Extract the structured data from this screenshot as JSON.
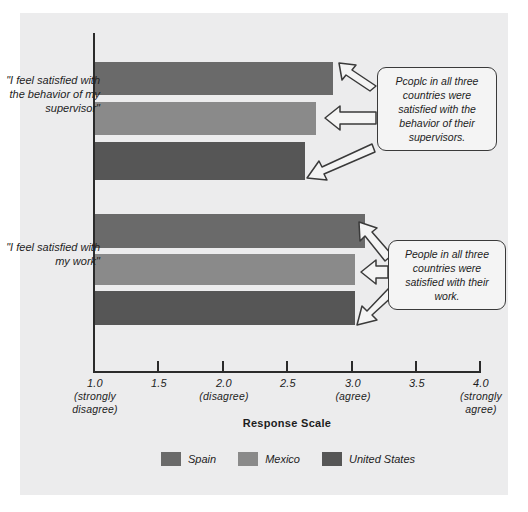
{
  "chart_data": {
    "type": "bar",
    "orientation": "horizontal",
    "title": "",
    "xlabel": "Response Scale",
    "ylabel": "",
    "xlim": [
      1.0,
      4.0
    ],
    "grid": false,
    "legend_position": "bottom",
    "categories": [
      "\"I feel satisfied with the behavior of my supervisor\"",
      "\"I feel satisfied with my work\""
    ],
    "series": [
      {
        "name": "Spain",
        "color": "#6a6a6a",
        "values": [
          2.85,
          3.1
        ]
      },
      {
        "name": "Mexico",
        "color": "#8a8a8a",
        "values": [
          2.72,
          3.02
        ]
      },
      {
        "name": "United States",
        "color": "#565656",
        "values": [
          2.63,
          3.02
        ]
      }
    ],
    "xticks": [
      {
        "value": 1.0,
        "label": "1.0",
        "sublabel": "(strongly disagree)"
      },
      {
        "value": 1.5,
        "label": "1.5",
        "sublabel": ""
      },
      {
        "value": 2.0,
        "label": "2.0",
        "sublabel": "(disagree)"
      },
      {
        "value": 2.5,
        "label": "2.5",
        "sublabel": ""
      },
      {
        "value": 3.0,
        "label": "3.0",
        "sublabel": "(agree)"
      },
      {
        "value": 3.5,
        "label": "3.5",
        "sublabel": ""
      },
      {
        "value": 4.0,
        "label": "4.0",
        "sublabel": "(strongly agree)"
      }
    ],
    "annotations": [
      "Pcoplc in all three countries were satisfied with the behavior of their supervisors.",
      "People in all three countries were satisfied with their work."
    ]
  },
  "axis": {
    "x_title": "Response Scale",
    "tick_1_0": "1.0",
    "tick_1_0_sub": "(strongly disagree)",
    "tick_1_5": "1.5",
    "tick_2_0": "2.0",
    "tick_2_0_sub": "(disagree)",
    "tick_2_5": "2.5",
    "tick_3_0": "3.0",
    "tick_3_0_sub": "(agree)",
    "tick_3_5": "3.5",
    "tick_4_0": "4.0",
    "tick_4_0_sub": "(strongly agree)"
  },
  "categories": {
    "supervisor": "\"I feel satisfied with the behavior of my supervisor\"",
    "work": "\"I feel satisfied with my work\""
  },
  "annotations": {
    "supervisor_note": "Pcoplc in all three countries were satisfied with the behavior of their supervisors.",
    "work_note": "People in all three countries were satisfied with their work."
  },
  "legend": {
    "items": [
      {
        "label": "Spain",
        "color": "#6a6a6a"
      },
      {
        "label": "Mexico",
        "color": "#8a8a8a"
      },
      {
        "label": "United States",
        "color": "#565656"
      }
    ]
  }
}
